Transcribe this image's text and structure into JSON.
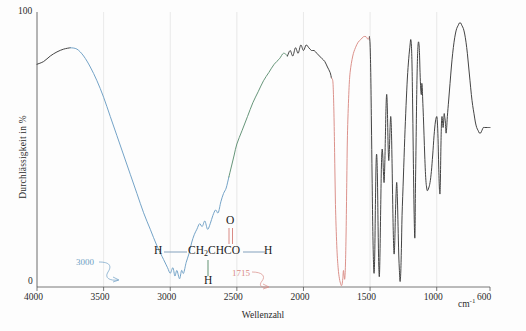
{
  "chart_data": {
    "type": "line",
    "title": "",
    "xlabel": "Wellenzahl",
    "ylabel": "Durchlässigkeit in %",
    "xunit": "cm",
    "xunit_exp": "-1",
    "xlim": [
      4000,
      600
    ],
    "ylim": [
      0,
      100
    ],
    "x_ticks": [
      4000,
      3500,
      3000,
      2500,
      2000,
      1500,
      1000,
      600
    ],
    "x_tick_labels": [
      "4000",
      "3500",
      "3000",
      "2500",
      "2000",
      "1500",
      "1000",
      "600"
    ],
    "y_ticks": [
      0,
      100
    ],
    "y_tick_labels": [
      "0",
      "100"
    ],
    "grid": "vertical",
    "grid_color": "#e3e3e3",
    "axis_color": "#555555",
    "legend": "none",
    "annotations": [
      {
        "text": "3000",
        "color": "#6d9ec4",
        "points_to_x": 3000,
        "points_to_y": 4
      },
      {
        "text": "1715",
        "color": "#d98b85",
        "points_to_x": 1715,
        "points_to_y": 2
      }
    ],
    "series": [
      {
        "name": "IR transmittance spectrum",
        "segments": [
          {
            "color": "#3a3a3a",
            "name": "baseline-black-left"
          },
          {
            "color": "#6d9ec4",
            "name": "oh-stretch-blue"
          },
          {
            "color": "#5e8f72",
            "name": "ch-stretch-green"
          },
          {
            "color": "#3a3a3a",
            "name": "mid-black"
          },
          {
            "color": "#d98b85",
            "name": "carbonyl-red"
          },
          {
            "color": "#3a3a3a",
            "name": "fingerprint-black"
          }
        ],
        "points": [
          [
            4000,
            81
          ],
          [
            3950,
            82
          ],
          [
            3900,
            84
          ],
          [
            3850,
            85.5
          ],
          [
            3800,
            86.5
          ],
          [
            3750,
            87
          ],
          [
            3700,
            86.5
          ],
          [
            3650,
            84
          ],
          [
            3600,
            80
          ],
          [
            3550,
            75
          ],
          [
            3500,
            69
          ],
          [
            3450,
            62
          ],
          [
            3400,
            55
          ],
          [
            3350,
            48
          ],
          [
            3300,
            41
          ],
          [
            3250,
            34
          ],
          [
            3200,
            27
          ],
          [
            3150,
            21
          ],
          [
            3100,
            15
          ],
          [
            3050,
            10
          ],
          [
            3020,
            7
          ],
          [
            3000,
            5
          ],
          [
            2980,
            7
          ],
          [
            2965,
            4
          ],
          [
            2950,
            6
          ],
          [
            2930,
            3
          ],
          [
            2915,
            6
          ],
          [
            2900,
            5
          ],
          [
            2880,
            9
          ],
          [
            2860,
            12
          ],
          [
            2840,
            16
          ],
          [
            2820,
            19
          ],
          [
            2800,
            21
          ],
          [
            2780,
            23
          ],
          [
            2760,
            22
          ],
          [
            2740,
            24
          ],
          [
            2720,
            21
          ],
          [
            2700,
            23
          ],
          [
            2680,
            26
          ],
          [
            2660,
            28
          ],
          [
            2640,
            27
          ],
          [
            2620,
            31
          ],
          [
            2600,
            34
          ],
          [
            2580,
            36
          ],
          [
            2560,
            40
          ],
          [
            2540,
            44
          ],
          [
            2520,
            48
          ],
          [
            2500,
            52
          ],
          [
            2460,
            57
          ],
          [
            2420,
            62
          ],
          [
            2380,
            67
          ],
          [
            2340,
            71
          ],
          [
            2300,
            75
          ],
          [
            2260,
            78
          ],
          [
            2220,
            81
          ],
          [
            2180,
            83
          ],
          [
            2150,
            85
          ],
          [
            2120,
            84
          ],
          [
            2100,
            86
          ],
          [
            2080,
            84
          ],
          [
            2060,
            87
          ],
          [
            2040,
            85
          ],
          [
            2020,
            88
          ],
          [
            2000,
            86
          ],
          [
            1980,
            88
          ],
          [
            1960,
            87
          ],
          [
            1940,
            86
          ],
          [
            1920,
            86
          ],
          [
            1900,
            85
          ],
          [
            1880,
            84
          ],
          [
            1860,
            83
          ],
          [
            1840,
            82
          ],
          [
            1820,
            80
          ],
          [
            1800,
            78
          ],
          [
            1790,
            76
          ],
          [
            1780,
            75
          ],
          [
            1775,
            70
          ],
          [
            1770,
            60
          ],
          [
            1765,
            45
          ],
          [
            1760,
            30
          ],
          [
            1750,
            15
          ],
          [
            1740,
            7
          ],
          [
            1730,
            3
          ],
          [
            1720,
            1
          ],
          [
            1715,
            0.5
          ],
          [
            1710,
            1
          ],
          [
            1705,
            3
          ],
          [
            1700,
            6
          ],
          [
            1695,
            4
          ],
          [
            1690,
            3
          ],
          [
            1685,
            8
          ],
          [
            1680,
            20
          ],
          [
            1675,
            38
          ],
          [
            1670,
            55
          ],
          [
            1660,
            70
          ],
          [
            1650,
            78
          ],
          [
            1630,
            84
          ],
          [
            1610,
            87
          ],
          [
            1590,
            89
          ],
          [
            1570,
            90
          ],
          [
            1550,
            91
          ],
          [
            1530,
            91
          ],
          [
            1515,
            90
          ],
          [
            1505,
            91
          ],
          [
            1500,
            88
          ],
          [
            1495,
            78
          ],
          [
            1490,
            60
          ],
          [
            1485,
            40
          ],
          [
            1480,
            22
          ],
          [
            1475,
            10
          ],
          [
            1470,
            5
          ],
          [
            1465,
            12
          ],
          [
            1460,
            30
          ],
          [
            1455,
            45
          ],
          [
            1450,
            48
          ],
          [
            1445,
            40
          ],
          [
            1440,
            22
          ],
          [
            1435,
            8
          ],
          [
            1430,
            4
          ],
          [
            1425,
            14
          ],
          [
            1420,
            30
          ],
          [
            1415,
            44
          ],
          [
            1410,
            50
          ],
          [
            1405,
            48
          ],
          [
            1400,
            42
          ],
          [
            1395,
            38
          ],
          [
            1390,
            44
          ],
          [
            1385,
            55
          ],
          [
            1380,
            66
          ],
          [
            1375,
            70
          ],
          [
            1370,
            64
          ],
          [
            1365,
            52
          ],
          [
            1360,
            46
          ],
          [
            1355,
            50
          ],
          [
            1350,
            58
          ],
          [
            1345,
            62
          ],
          [
            1340,
            57
          ],
          [
            1335,
            45
          ],
          [
            1330,
            30
          ],
          [
            1325,
            18
          ],
          [
            1320,
            12
          ],
          [
            1315,
            16
          ],
          [
            1310,
            26
          ],
          [
            1305,
            34
          ],
          [
            1300,
            38
          ],
          [
            1295,
            32
          ],
          [
            1290,
            22
          ],
          [
            1285,
            12
          ],
          [
            1280,
            6
          ],
          [
            1275,
            2
          ],
          [
            1270,
            5
          ],
          [
            1265,
            14
          ],
          [
            1260,
            26
          ],
          [
            1250,
            40
          ],
          [
            1240,
            54
          ],
          [
            1230,
            66
          ],
          [
            1220,
            76
          ],
          [
            1210,
            83
          ],
          [
            1200,
            88
          ],
          [
            1195,
            90
          ],
          [
            1190,
            88
          ],
          [
            1185,
            80
          ],
          [
            1180,
            64
          ],
          [
            1175,
            45
          ],
          [
            1170,
            28
          ],
          [
            1165,
            18
          ],
          [
            1162,
            22
          ],
          [
            1160,
            34
          ],
          [
            1155,
            52
          ],
          [
            1150,
            70
          ],
          [
            1145,
            82
          ],
          [
            1140,
            88
          ],
          [
            1135,
            89
          ],
          [
            1130,
            86
          ],
          [
            1125,
            78
          ],
          [
            1120,
            72
          ],
          [
            1115,
            70
          ],
          [
            1112,
            74
          ],
          [
            1108,
            72
          ],
          [
            1105,
            68
          ],
          [
            1100,
            62
          ],
          [
            1095,
            55
          ],
          [
            1090,
            48
          ],
          [
            1085,
            42
          ],
          [
            1080,
            38
          ],
          [
            1075,
            36
          ],
          [
            1070,
            35
          ],
          [
            1060,
            36
          ],
          [
            1050,
            38
          ],
          [
            1040,
            42
          ],
          [
            1030,
            48
          ],
          [
            1020,
            55
          ],
          [
            1010,
            60
          ],
          [
            1000,
            62
          ],
          [
            995,
            60
          ],
          [
            990,
            54
          ],
          [
            985,
            44
          ],
          [
            980,
            36
          ],
          [
            975,
            34
          ],
          [
            972,
            40
          ],
          [
            968,
            52
          ],
          [
            964,
            60
          ],
          [
            960,
            62
          ],
          [
            956,
            60
          ],
          [
            952,
            58
          ],
          [
            948,
            60
          ],
          [
            944,
            63
          ],
          [
            940,
            62
          ],
          [
            935,
            60
          ],
          [
            930,
            56
          ],
          [
            925,
            58
          ],
          [
            920,
            62
          ],
          [
            910,
            68
          ],
          [
            900,
            74
          ],
          [
            890,
            80
          ],
          [
            880,
            85
          ],
          [
            870,
            89
          ],
          [
            860,
            92
          ],
          [
            850,
            94
          ],
          [
            840,
            95
          ],
          [
            830,
            96
          ],
          [
            820,
            96
          ],
          [
            810,
            95
          ],
          [
            800,
            94
          ],
          [
            790,
            92
          ],
          [
            780,
            89
          ],
          [
            770,
            85
          ],
          [
            760,
            80
          ],
          [
            750,
            75
          ],
          [
            740,
            70
          ],
          [
            730,
            66
          ],
          [
            720,
            63
          ],
          [
            710,
            60
          ],
          [
            700,
            58
          ],
          [
            690,
            57
          ],
          [
            680,
            56
          ],
          [
            670,
            56
          ],
          [
            660,
            57
          ],
          [
            650,
            58
          ],
          [
            640,
            58
          ],
          [
            630,
            58
          ],
          [
            620,
            58
          ],
          [
            610,
            58
          ],
          [
            600,
            58
          ]
        ]
      }
    ]
  },
  "structure": {
    "name": "propanoic-acid-like-skeleton",
    "left_h": "H",
    "backbone": "CH2CHCO",
    "backbone_sub": "2",
    "right_h": "H",
    "bottom_h": "H",
    "top_o": "O",
    "bond_colors": {
      "left": "#8fa9c4",
      "right": "#8fa9c4",
      "bottom": "#6f9c7f",
      "top": "#d98b85"
    }
  }
}
